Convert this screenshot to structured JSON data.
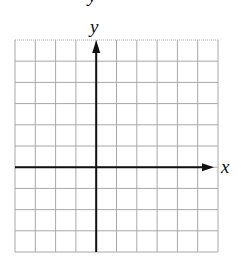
{
  "diagram": {
    "type": "coordinate-plane",
    "x_axis_label": "x",
    "y_axis_label": "y",
    "top_fragment_label": "y",
    "grid": {
      "columns": 10,
      "rows": 10,
      "left": 15,
      "top": 40,
      "right": 218,
      "bottom": 252,
      "y_axis_column_index": 4,
      "x_axis_row_index": 6
    },
    "colors": {
      "grid": "#a8a8a8",
      "axis": "#111111",
      "label": "#111111",
      "background": "#ffffff"
    }
  }
}
